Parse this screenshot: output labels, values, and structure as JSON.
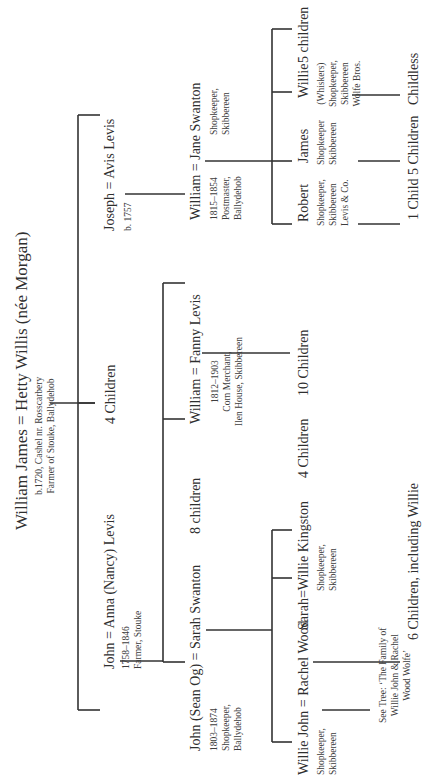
{
  "tree": {
    "root": {
      "couple": "William James = Hetty Willis (née Morgan)",
      "details": [
        "b.1720, Cashel nr. Rosscarbery",
        "Farmer of Stouke, Ballydehob"
      ],
      "children_note": "4 Children"
    },
    "generation2": [
      {
        "couple": "John = Anna (Nancy) Levis",
        "details": [
          "1758–1846",
          "Farmer, Stouke"
        ]
      },
      {
        "couple": "Joseph = Avis Levis",
        "details": [
          "b. 1757"
        ]
      }
    ],
    "generation3": [
      {
        "couple": "John (Sean Og) = Sarah Swanton",
        "details": [
          "1803–1874",
          "Shopkeeper,",
          "Ballydehob"
        ]
      },
      {
        "note": "8 children"
      },
      {
        "couple": "William = Fanny Levis",
        "details": [
          "1812–1903",
          "Corn Merchant,",
          "Ilen House, Skibbereen"
        ],
        "children_note": "10 Children"
      },
      {
        "couple": "William = Jane Swanton",
        "details_left": [
          "1815–1854",
          "Postmaster,",
          "Ballydehob"
        ],
        "details_right": [
          "Shopkeeper,",
          "Skibbereen"
        ]
      }
    ],
    "generation4": [
      {
        "couple": "Willie John = Rachel Wood",
        "details": [
          "Shopkeeper,",
          "Skibbereen"
        ],
        "see_tree": [
          "See Tree: ‘The Family of",
          "Willie John & Rachel",
          "Wood Wolfe’"
        ]
      },
      {
        "couple": "Sarah=Willie Kingston",
        "details": [
          "Shopkeeper,",
          "Skibbereen"
        ],
        "children_note": "6 Children, including Willie"
      },
      {
        "note": "4 Children"
      },
      {
        "name": "Robert",
        "details": [
          "Shopkeeper,",
          "Skibbereen",
          "Levis & Co."
        ],
        "children_note": "1 Child"
      },
      {
        "name": "James",
        "details": [
          "Shopkeeper",
          "Skibbereen"
        ],
        "children_note": "5 Children"
      },
      {
        "name": "Willie",
        "details": [
          "(Whiskers)",
          "Shopkeeper,",
          "Skibbereen",
          "Wolfe Bros."
        ],
        "children_note": "Childless"
      },
      {
        "note": "5 children"
      }
    ]
  },
  "colors": {
    "line": "#333333",
    "text": "#2f2f2f",
    "background": "#ffffff"
  }
}
